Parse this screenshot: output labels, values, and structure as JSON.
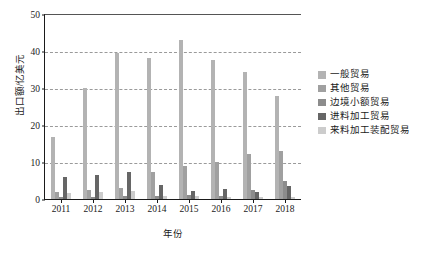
{
  "chart_data": {
    "type": "bar",
    "title": "",
    "subtitle": "",
    "xlabel": "年份",
    "ylabel": "出口额/亿美元",
    "categories": [
      "2011",
      "2012",
      "2013",
      "2014",
      "2015",
      "2016",
      "2017",
      "2018"
    ],
    "ylim": [
      0,
      50
    ],
    "yticks": [
      0,
      10,
      20,
      30,
      40,
      50
    ],
    "ytick_labels": [
      "0",
      "10",
      "20",
      "30",
      "40",
      "50"
    ],
    "grid": "horizontal-dashed",
    "legend_position": "right",
    "series": [
      {
        "name": "一般贸易",
        "color": "#b3b3b3",
        "values": [
          16.8,
          29.9,
          39.6,
          38.0,
          43.1,
          37.6,
          34.4,
          27.9
        ]
      },
      {
        "name": "其他贸易",
        "color": "#a0a0a0",
        "values": [
          1.9,
          2.4,
          2.9,
          7.2,
          8.9,
          9.9,
          12.1,
          13.1
        ]
      },
      {
        "name": "边境小额贸易",
        "color": "#8c8c8c",
        "values": [
          0.5,
          0.6,
          0.7,
          0.8,
          1.0,
          0.9,
          2.4,
          5.0
        ]
      },
      {
        "name": "进料加工贸易",
        "color": "#666666",
        "values": [
          6.0,
          6.4,
          7.2,
          3.7,
          2.3,
          2.6,
          1.8,
          3.5
        ]
      },
      {
        "name": "来料加工装配贸易",
        "color": "#cccccc",
        "values": [
          1.6,
          2.0,
          2.3,
          0.8,
          0.7,
          0.6,
          0.5,
          0.5
        ]
      }
    ]
  },
  "axes": {
    "y_title": "出口额/亿美元",
    "x_title": "年份"
  }
}
